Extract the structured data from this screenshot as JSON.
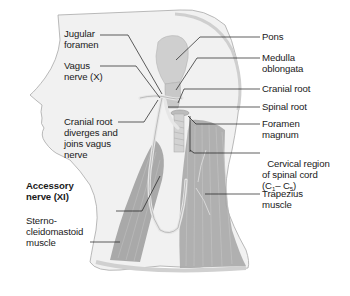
{
  "figure": {
    "colors": {
      "background": "#ffffff",
      "skin": "#f1f1f1",
      "outline": "#a8a8a8",
      "muscle": "#9a9a9a",
      "muscle_stripe": "#bdbdbd",
      "brainstem": "#cfcfcf",
      "nerve": "#e4e4e4",
      "leader_line": "#1a1a1a",
      "text": "#1a1a1a"
    }
  },
  "labels_left": [
    {
      "id": "jugular-foramen",
      "text": "Jugular\nforamen",
      "bold": false
    },
    {
      "id": "vagus-nerve",
      "text": "Vagus\nnerve (X)",
      "bold": false
    },
    {
      "id": "cranial-root-diverges",
      "text": "Cranial root\ndiverges and\njoins vagus\nnerve",
      "bold": false
    },
    {
      "id": "accessory-nerve",
      "text": "Accessory\nnerve (XI)",
      "bold": true
    },
    {
      "id": "sternocleidomastoid",
      "text": "Sterno-\ncleidomastoid\nmuscle",
      "bold": false
    }
  ],
  "labels_right": [
    {
      "id": "pons",
      "text": "Pons"
    },
    {
      "id": "medulla-oblongata",
      "text": "Medulla\noblongata"
    },
    {
      "id": "cranial-root",
      "text": "Cranial root"
    },
    {
      "id": "spinal-root",
      "text": "Spinal root"
    },
    {
      "id": "foramen-magnum",
      "text": "Foramen\nmagnum"
    },
    {
      "id": "cervical-region",
      "text": "Cervical region\nof spinal cord",
      "sub_line": {
        "prefix": "(C",
        "sub1": "1",
        "mid": "– C",
        "sub2": "5",
        "suffix": ")"
      }
    },
    {
      "id": "trapezius",
      "text": "Trapezius\nmuscle"
    }
  ]
}
